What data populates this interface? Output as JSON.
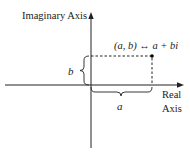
{
  "diagram": {
    "axes": {
      "vertical_label": "Imaginary Axis",
      "horizontal_label_line1": "Real",
      "horizontal_label_line2": "Axis"
    },
    "point": {
      "label": "(a, b) ↔ a + bi"
    },
    "braces": {
      "vertical_label": "b",
      "horizontal_label": "a"
    },
    "colors": {
      "axis": "#222222",
      "dashed": "#222222",
      "point": "#000000",
      "background": "#ffffff"
    }
  }
}
